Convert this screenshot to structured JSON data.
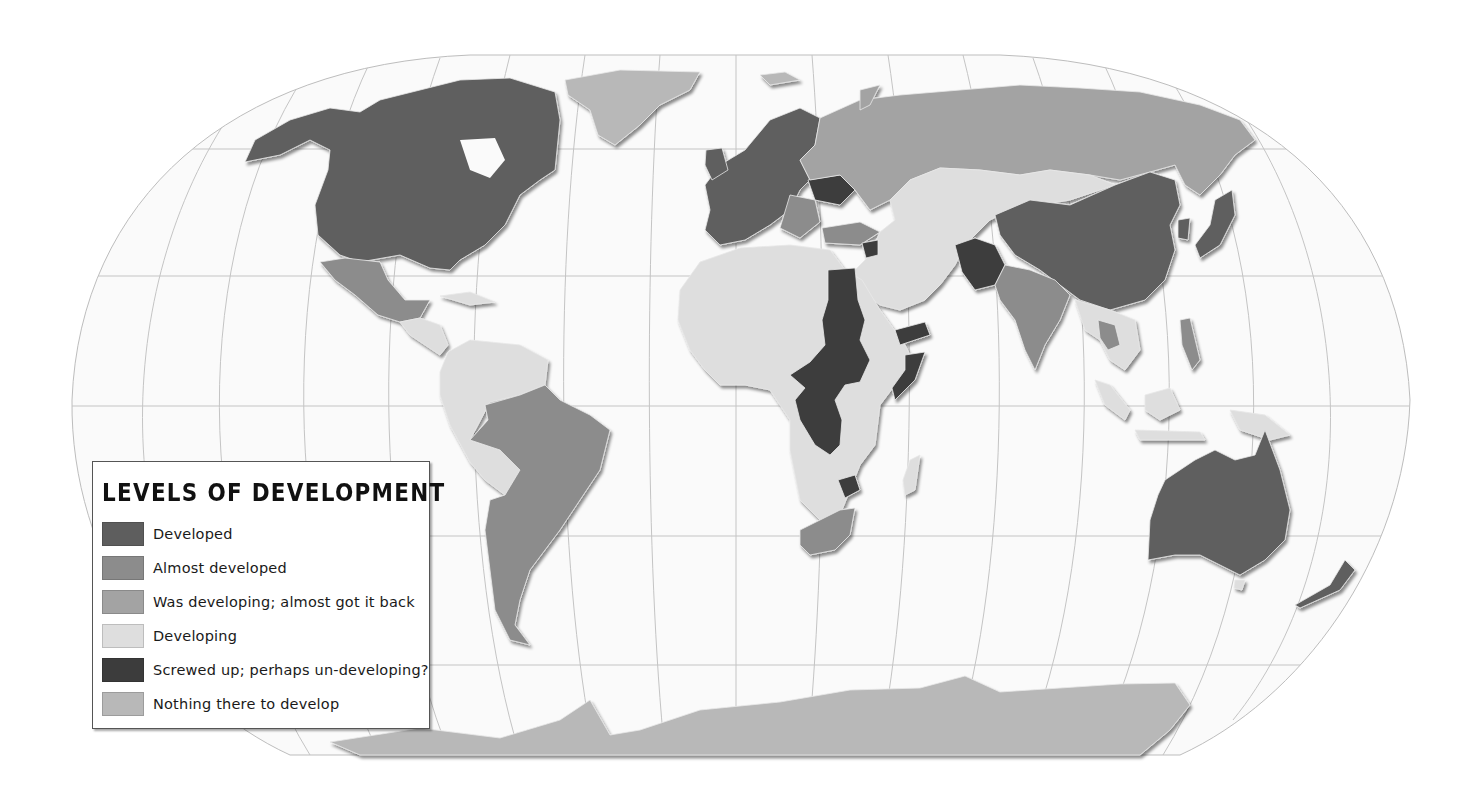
{
  "legend": {
    "title": "LEVELS OF DEVELOPMENT",
    "items": [
      {
        "label": "Developed",
        "color": "#5e5e5e"
      },
      {
        "label": "Almost developed",
        "color": "#8c8c8c"
      },
      {
        "label": "Was developing; almost got it back",
        "color": "#a3a3a3"
      },
      {
        "label": "Developing",
        "color": "#dedede"
      },
      {
        "label": "Screwed up; perhaps un-developing?",
        "color": "#3c3c3c"
      },
      {
        "label": "Nothing there to develop",
        "color": "#b8b8b8"
      }
    ]
  },
  "map": {
    "projection": "Robinson",
    "ocean_color": "#fafafa",
    "graticule_color": "#bdbdbd",
    "regions": [
      {
        "name": "North America (USA, Canada)",
        "category": "Developed"
      },
      {
        "name": "Mexico",
        "category": "Almost developed"
      },
      {
        "name": "Central America & Caribbean",
        "category": "Developing"
      },
      {
        "name": "Greenland",
        "category": "Nothing there to develop"
      },
      {
        "name": "Brazil, Argentina, Chile, Uruguay",
        "category": "Almost developed"
      },
      {
        "name": "Northern & Western South America, Bolivia",
        "category": "Developing"
      },
      {
        "name": "Western Europe",
        "category": "Developed"
      },
      {
        "name": "Ukraine, Belarus",
        "category": "Screwed up; perhaps un-developing?"
      },
      {
        "name": "Russia",
        "category": "Was developing; almost got it back"
      },
      {
        "name": "Turkey, Eastern Europe",
        "category": "Almost developed"
      },
      {
        "name": "Central Asia, Mongolia, Middle East",
        "category": "Developing"
      },
      {
        "name": "Afghanistan, Pakistan, Syria",
        "category": "Screwed up; perhaps un-developing?"
      },
      {
        "name": "China, Japan, South Korea",
        "category": "Developed"
      },
      {
        "name": "India, Thailand, Malaysia",
        "category": "Almost developed"
      },
      {
        "name": "Southeast Asia, Indonesia, Papua New Guinea",
        "category": "Developing"
      },
      {
        "name": "Australia, New Zealand",
        "category": "Developed"
      },
      {
        "name": "Africa (most)",
        "category": "Developing"
      },
      {
        "name": "Egypt, Sudan, Central African Rep., DR Congo, Somalia, Yemen, Zimbabwe",
        "category": "Screwed up; perhaps un-developing?"
      },
      {
        "name": "South Africa",
        "category": "Almost developed"
      },
      {
        "name": "Antarctica",
        "category": "Nothing there to develop"
      }
    ]
  }
}
